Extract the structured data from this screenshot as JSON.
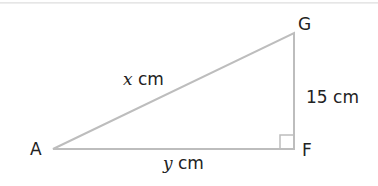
{
  "diagram": {
    "type": "right-triangle",
    "vertices": {
      "A": {
        "label": "A"
      },
      "F": {
        "label": "F"
      },
      "G": {
        "label": "G"
      }
    },
    "sides": {
      "hypotenuse_AG": {
        "var": "x",
        "unit": "cm"
      },
      "base_AF": {
        "var": "y",
        "unit": "cm"
      },
      "height_FG": {
        "value": "15",
        "unit": "cm",
        "text": "15 cm"
      }
    },
    "right_angle_at": "F",
    "colors": {
      "line": "#b8b8b8",
      "text": "#222222"
    }
  }
}
